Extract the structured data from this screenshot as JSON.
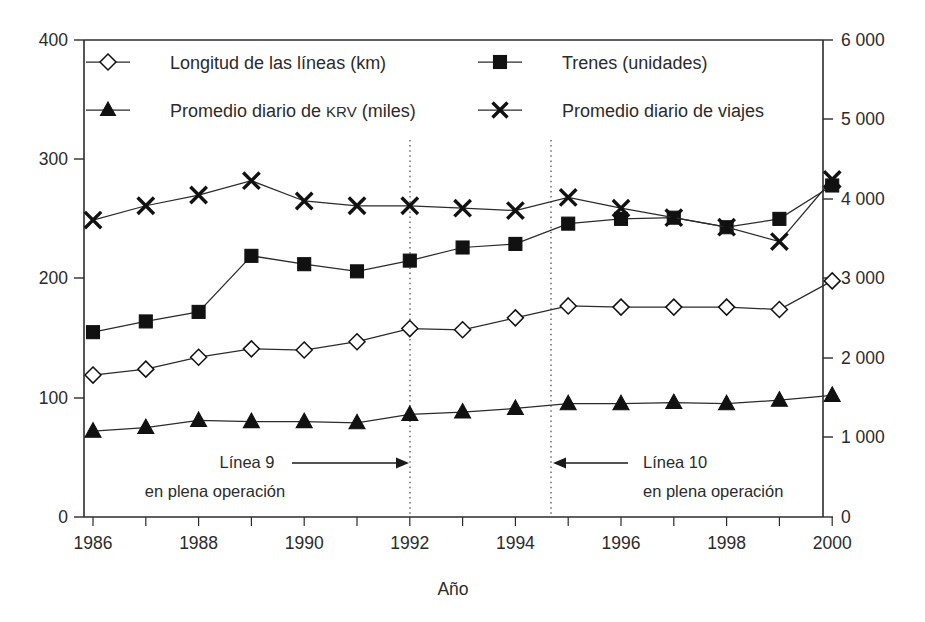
{
  "chart_data": {
    "type": "line",
    "title": "",
    "xlabel": "Año",
    "ylabel": "",
    "x": [
      1986,
      1987,
      1988,
      1989,
      1990,
      1991,
      1992,
      1993,
      1994,
      1995,
      1996,
      1997,
      1998,
      1999,
      2000
    ],
    "xtick_labels": [
      "1986",
      "1988",
      "1990",
      "1992",
      "1994",
      "1996",
      "1998",
      "2000"
    ],
    "xtick_values": [
      1986,
      1988,
      1990,
      1992,
      1994,
      1996,
      1998,
      2000
    ],
    "xlim": [
      1985.5,
      2000.6
    ],
    "left_axis": {
      "label": "",
      "ylim": [
        0,
        400
      ],
      "ticks": [
        0,
        100,
        200,
        300,
        400
      ],
      "tick_labels": [
        "0",
        "100",
        "200",
        "300",
        "400"
      ]
    },
    "right_axis": {
      "label": "",
      "ylim": [
        0,
        6000
      ],
      "ticks": [
        0,
        1000,
        2000,
        3000,
        4000,
        5000,
        6000
      ],
      "tick_labels": [
        "0",
        "1 000",
        "2 000",
        "3 000",
        "4 000",
        "5 000",
        "6 000"
      ]
    },
    "grid": false,
    "legend_position": "top-inside",
    "series": [
      {
        "name": "Longitud de las líneas (km)",
        "marker": "diamond-open",
        "axis": "left",
        "values": [
          119,
          124,
          134,
          141,
          140,
          147,
          158,
          157,
          167,
          177,
          176,
          176,
          176,
          174,
          198
        ]
      },
      {
        "name": "Trenes (unidades)",
        "marker": "square-filled",
        "axis": "left",
        "values": [
          155,
          164,
          172,
          219,
          212,
          206,
          215,
          226,
          229,
          246,
          250,
          251,
          243,
          250,
          278
        ]
      },
      {
        "name": "Promedio diario de KRV (miles)",
        "marker": "triangle-filled",
        "axis": "left",
        "values": [
          72,
          75,
          81,
          80,
          80,
          79,
          86,
          88,
          91,
          95,
          95,
          96,
          95,
          98,
          102
        ]
      },
      {
        "name": "Promedio diario de viajes",
        "marker": "x-cross",
        "axis": "left",
        "values": [
          249,
          261,
          270,
          282,
          265,
          261,
          261,
          259,
          257,
          268,
          259,
          251,
          243,
          231,
          283
        ]
      }
    ],
    "annotations": [
      {
        "name": "linea-9",
        "line1": "Línea 9",
        "line2": "en plena operación",
        "arrow": "right",
        "target_x": 1992
      },
      {
        "name": "linea-10",
        "line1": "Línea 10",
        "line2": "en plena operación",
        "arrow": "left",
        "target_x": 1995
      }
    ],
    "vertical_markers": [
      {
        "name": "marker-1992",
        "x": 1992,
        "style": "dotted"
      },
      {
        "name": "marker-1995",
        "x": 1995,
        "style": "dotted"
      }
    ],
    "colors": {
      "axis": "#2b2b2b",
      "series": "#111111",
      "dotted": "#6b6b6b",
      "background": "#ffffff"
    }
  },
  "legend": {
    "entries": [
      {
        "label": "Longitud de las líneas (km)",
        "marker": "diamond-open"
      },
      {
        "label": "Trenes (unidades)",
        "marker": "square-filled"
      },
      {
        "label_pre": "Promedio diario de ",
        "label_sc": "krv",
        "label_post": " (miles)",
        "label": "Promedio diario de KRV (miles)",
        "marker": "triangle-filled"
      },
      {
        "label": "Promedio diario de viajes",
        "marker": "x-cross"
      }
    ]
  },
  "axes": {
    "x_title": "Año",
    "left_ticks": [
      "400",
      "300",
      "200",
      "100",
      "0"
    ],
    "right_ticks": [
      "6 000",
      "5 000",
      "4 000",
      "3 000",
      "2 000",
      "1 000",
      "0"
    ],
    "x_ticks": [
      "1986",
      "1988",
      "1990",
      "1992",
      "1994",
      "1996",
      "1998",
      "2000"
    ]
  },
  "annotations": {
    "left": {
      "line1": "Línea 9",
      "line2": "en plena operación"
    },
    "right": {
      "line1": "Línea 10",
      "line2": "en plena operación"
    }
  }
}
